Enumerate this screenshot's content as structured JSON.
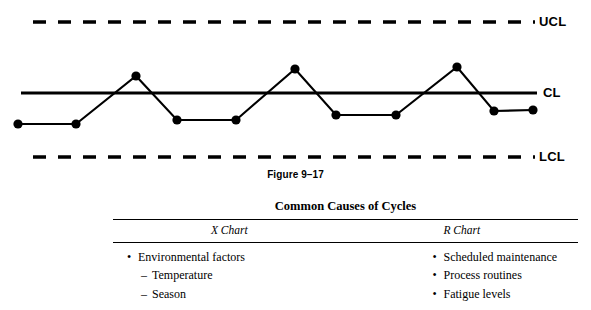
{
  "chart_data": {
    "type": "line",
    "xlabel": "",
    "ylabel": "",
    "grid": false,
    "legend": "none",
    "series": [
      {
        "name": "Sample values",
        "x": [
          1,
          2,
          3,
          4,
          5,
          6,
          7,
          8,
          9,
          10,
          11,
          12,
          13,
          14
        ],
        "values": [
          -1.0,
          -1.0,
          0.55,
          -0.87,
          -0.87,
          0.78,
          -0.71,
          -0.71,
          0.9,
          -0.58,
          -0.55,
          0,
          0,
          0
        ]
      }
    ],
    "reference_lines": [
      {
        "id": "ucl",
        "label": "UCL",
        "value": 3.0,
        "style": "dashed"
      },
      {
        "id": "cl",
        "label": "CL",
        "value": 0.0,
        "style": "solid"
      },
      {
        "id": "lcl",
        "label": "LCL",
        "value": -3.0,
        "style": "dashed"
      }
    ],
    "ylim": [
      -3.6,
      3.6
    ],
    "xlim": [
      0,
      15
    ]
  },
  "chart": {
    "ucl_label": "UCL",
    "cl_label": "CL",
    "lcl_label": "LCL",
    "caption": "Figure 9–17",
    "points": [
      {
        "x": 18,
        "y": 124
      },
      {
        "x": 76,
        "y": 124
      },
      {
        "x": 136,
        "y": 76
      },
      {
        "x": 177,
        "y": 120
      },
      {
        "x": 236,
        "y": 120
      },
      {
        "x": 295,
        "y": 69
      },
      {
        "x": 336,
        "y": 115
      },
      {
        "x": 396,
        "y": 115
      },
      {
        "x": 457,
        "y": 67
      },
      {
        "x": 494,
        "y": 111
      },
      {
        "x": 533,
        "y": 110
      }
    ],
    "lines": {
      "ucl_y": 22,
      "cl_y": 93,
      "lcl_y": 157,
      "x_start": 33,
      "x_end": 535
    }
  },
  "table": {
    "title": "Common Causes of Cycles",
    "columns": [
      {
        "header": "X Chart"
      },
      {
        "header": "R Chart"
      }
    ],
    "x_chart_items": [
      {
        "mark": "•",
        "text": "Environmental factors",
        "level": 1
      },
      {
        "mark": "–",
        "text": "Temperature",
        "level": 2
      },
      {
        "mark": "–",
        "text": "Season",
        "level": 2
      }
    ],
    "r_chart_items": [
      {
        "mark": "•",
        "text": "Scheduled maintenance",
        "level": 1
      },
      {
        "mark": "•",
        "text": "Process routines",
        "level": 1
      },
      {
        "mark": "•",
        "text": "Fatigue levels",
        "level": 1
      }
    ]
  }
}
